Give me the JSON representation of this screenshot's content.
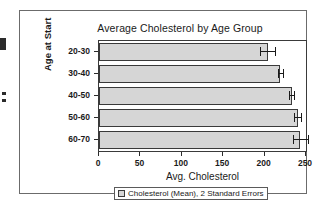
{
  "chart_data": {
    "type": "bar",
    "orientation": "horizontal",
    "title": "Average Cholesterol by Age Group",
    "xlabel": "Avg. Cholesterol",
    "ylabel": "Age at Start",
    "categories": [
      "20-30",
      "30-40",
      "40-50",
      "50-60",
      "60-70"
    ],
    "values": [
      204,
      219,
      233,
      240,
      243
    ],
    "errors": [
      9,
      3,
      3,
      4,
      9
    ],
    "error_type": "2 Standard Errors",
    "xlim": [
      0,
      250
    ],
    "xticks": [
      0,
      50,
      100,
      150,
      200,
      250
    ],
    "xtick_labels": [
      "0",
      "50",
      "100",
      "150",
      "200",
      "250"
    ],
    "grid": false,
    "legend_position": "bottom",
    "legend": [
      {
        "label": "Cholesterol (Mean), 2 Standard Errors",
        "color": "#d6d6d6"
      }
    ],
    "series": [
      {
        "name": "Cholesterol (Mean), 2 Standard Errors",
        "values": [
          204,
          219,
          233,
          240,
          243
        ]
      }
    ]
  },
  "colors": {
    "bar_fill": "#d6d6d6",
    "bar_outline": "#3a3a3a",
    "axis": "#2b2b2b",
    "frame": "#6b6b6b",
    "background": "#ffffff"
  }
}
